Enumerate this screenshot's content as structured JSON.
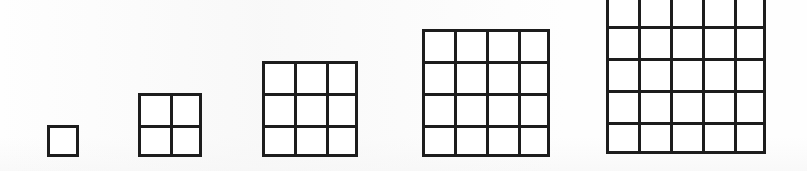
{
  "figure": {
    "background_color": "#ffffff",
    "ink_color": "#1d1d1d",
    "canvas_width": 807,
    "canvas_height": 171,
    "baseline_y": 157,
    "cell_size_px": 32,
    "stroke_width_px": 3,
    "note": "Five bottom-aligned square grids; the fifth grid is clipped by the top edge of the image."
  },
  "chart_data": {
    "type": "bar",
    "subtitle": "",
    "xlabel": "",
    "ylabel": "",
    "categories": [
      "1",
      "2",
      "3",
      "4",
      "5"
    ],
    "values": [
      1,
      4,
      9,
      16,
      25
    ],
    "series": [
      {
        "name": "side length (n)",
        "values": [
          1,
          2,
          3,
          4,
          5
        ]
      },
      {
        "name": "unit squares (n squared)",
        "values": [
          1,
          4,
          9,
          16,
          25
        ]
      }
    ],
    "xlim": [
      0,
      6
    ],
    "ylim": [
      0,
      25
    ],
    "grid": true,
    "legend": "none",
    "tick_labels": [],
    "annotations": []
  },
  "grids": [
    {
      "name": "grid-1x1",
      "side": 1,
      "cells": 1,
      "label": "1",
      "left": 47,
      "top": 125,
      "width": 32,
      "height": 32,
      "clipped_top": false
    },
    {
      "name": "grid-2x2",
      "side": 2,
      "cells": 4,
      "label": "4",
      "left": 138,
      "top": 93,
      "width": 64,
      "height": 64,
      "clipped_top": false
    },
    {
      "name": "grid-3x3",
      "side": 3,
      "cells": 9,
      "label": "9",
      "left": 262,
      "top": 61,
      "width": 96,
      "height": 96,
      "clipped_top": false
    },
    {
      "name": "grid-4x4",
      "side": 4,
      "cells": 16,
      "label": "16",
      "left": 422,
      "top": 29,
      "width": 128,
      "height": 128,
      "clipped_top": false
    },
    {
      "name": "grid-5x5",
      "side": 5,
      "cells": 25,
      "label": "25",
      "left": 606,
      "top": -6,
      "width": 160,
      "height": 163,
      "clipped_top": true
    }
  ]
}
